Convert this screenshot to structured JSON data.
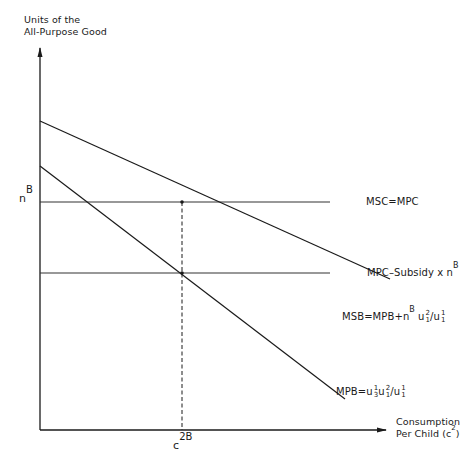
{
  "diagram": {
    "y_axis_label_line1": "Units of the",
    "y_axis_label_line2": "All-Purpose Good",
    "x_axis_label_line1": "Consumption",
    "x_axis_label_line2": "Per Child (c",
    "x_axis_label_sup": "2",
    "x_axis_label_close": ")",
    "y_tick_label_base": "n",
    "y_tick_label_sup": "B",
    "x_tick_label_base": "c",
    "x_tick_label_sup": "2B",
    "lines": {
      "msc": {
        "label": "MSC=MPC"
      },
      "subsidy": {
        "label_base": "MPC–Subsidy x n",
        "label_sup": "B"
      },
      "msb": {
        "label_base": "MSB=MPB+n",
        "label_sup": "B",
        "u_num_sup": "2",
        "u_num_sub": "1",
        "slash": "/",
        "u_den_sup": "1",
        "u_den_sub": "1",
        "u": "u"
      },
      "mpb": {
        "label_base": "MPB=",
        "u": "u",
        "a_sup": "1",
        "a_sub": "3",
        "b_sup": "2",
        "b_sub": "1",
        "slash": "/",
        "c_sup": "1",
        "c_sub": "1"
      }
    },
    "colors": {
      "ink": "#1a1a1a",
      "background": "#ffffff"
    }
  }
}
